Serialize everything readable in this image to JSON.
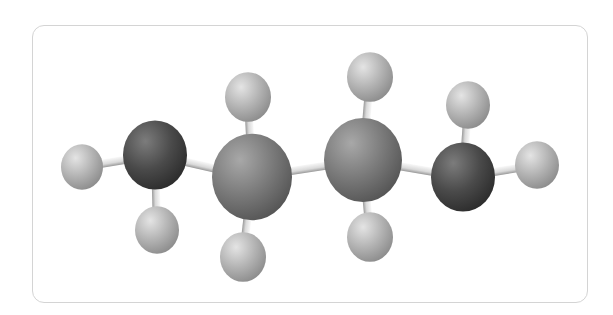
{
  "diagram": {
    "formula": "C4H10",
    "colors": {
      "frame_border": "#d4d4d4",
      "carbon_terminal": "#4a4a4a",
      "carbon_inner": "#7a7a7a",
      "hydrogen": "#b0b0b0",
      "bond": "#e6e6e6"
    },
    "atoms": [
      {
        "id": "H1",
        "element": "H",
        "x": 82,
        "y": 167,
        "r": 21
      },
      {
        "id": "C1",
        "element": "C",
        "x": 155,
        "y": 155,
        "r": 32,
        "shade": "terminal"
      },
      {
        "id": "H2",
        "element": "H",
        "x": 157,
        "y": 230,
        "r": 22
      },
      {
        "id": "H3",
        "element": "H",
        "x": 248,
        "y": 97,
        "r": 23
      },
      {
        "id": "C2",
        "element": "C",
        "x": 252,
        "y": 177,
        "r": 40,
        "shade": "inner"
      },
      {
        "id": "H4",
        "element": "H",
        "x": 243,
        "y": 257,
        "r": 23
      },
      {
        "id": "H5",
        "element": "H",
        "x": 370,
        "y": 77,
        "r": 23
      },
      {
        "id": "C3",
        "element": "C",
        "x": 363,
        "y": 160,
        "r": 39,
        "shade": "inner"
      },
      {
        "id": "H6",
        "element": "H",
        "x": 370,
        "y": 237,
        "r": 23
      },
      {
        "id": "H7",
        "element": "H",
        "x": 468,
        "y": 105,
        "r": 22
      },
      {
        "id": "C4",
        "element": "C",
        "x": 463,
        "y": 177,
        "r": 32,
        "shade": "terminal"
      },
      {
        "id": "H8",
        "element": "H",
        "x": 537,
        "y": 165,
        "r": 22
      }
    ],
    "bonds": [
      [
        "H1",
        "C1"
      ],
      [
        "C1",
        "H2"
      ],
      [
        "C1",
        "C2"
      ],
      [
        "H3",
        "C2"
      ],
      [
        "C2",
        "H4"
      ],
      [
        "C2",
        "C3"
      ],
      [
        "H5",
        "C3"
      ],
      [
        "C3",
        "H6"
      ],
      [
        "C3",
        "C4"
      ],
      [
        "H7",
        "C4"
      ],
      [
        "C4",
        "H8"
      ]
    ]
  }
}
